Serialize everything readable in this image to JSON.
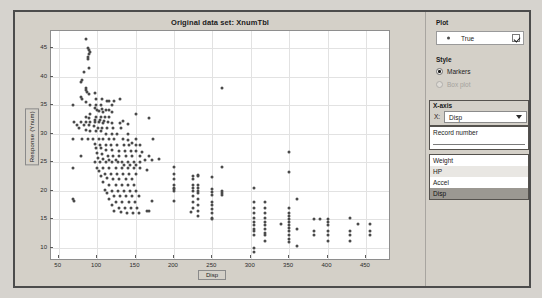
{
  "chart_data": {
    "type": "scatter",
    "title": "Original data set: XnumTbl",
    "xlabel": "Disp",
    "ylabel": "Response (Ynum)",
    "xlim": [
      40,
      480
    ],
    "ylim": [
      8,
      48
    ],
    "xticks": [
      50,
      100,
      150,
      200,
      250,
      300,
      350,
      400,
      450
    ],
    "yticks": [
      10,
      15,
      20,
      25,
      30,
      35,
      40,
      45
    ],
    "grid": true,
    "legend_position": "right-panel",
    "marker_color": "#4a4a4a",
    "series": [
      {
        "name": "True",
        "points": [
          [
            85,
            46.6
          ],
          [
            88,
            45.0
          ],
          [
            90,
            44.6
          ],
          [
            91,
            44.3
          ],
          [
            89,
            44.0
          ],
          [
            88,
            43.4
          ],
          [
            88,
            43.1
          ],
          [
            90,
            41.5
          ],
          [
            83,
            40.8
          ],
          [
            81,
            39.4
          ],
          [
            79,
            39.1
          ],
          [
            85,
            38.0
          ],
          [
            262,
            38.0
          ],
          [
            86,
            37.7
          ],
          [
            87,
            37.3
          ],
          [
            97,
            37.2
          ],
          [
            89,
            37.0
          ],
          [
            79,
            36.4
          ],
          [
            80,
            36.1
          ],
          [
            98,
            36.0
          ],
          [
            107,
            36.0
          ],
          [
            113,
            35.7
          ],
          [
            116,
            35.7
          ],
          [
            122,
            35.7
          ],
          [
            130,
            36.0
          ],
          [
            86,
            35.5
          ],
          [
            91,
            35.1
          ],
          [
            98,
            35.0
          ],
          [
            68,
            35.0
          ],
          [
            105,
            35.0
          ],
          [
            119,
            35.0
          ],
          [
            97,
            34.5
          ],
          [
            107,
            34.4
          ],
          [
            112,
            34.2
          ],
          [
            116,
            34.1
          ],
          [
            100,
            34.1
          ],
          [
            103,
            34.0
          ],
          [
            108,
            33.8
          ],
          [
            120,
            33.8
          ],
          [
            91,
            33.5
          ],
          [
            151,
            33.5
          ],
          [
            98,
            33.0
          ],
          [
            105,
            33.0
          ],
          [
            110,
            33.0
          ],
          [
            116,
            33.0
          ],
          [
            85,
            32.9
          ],
          [
            90,
            32.8
          ],
          [
            168,
            32.8
          ],
          [
            97,
            32.4
          ],
          [
            104,
            32.3
          ],
          [
            109,
            32.2
          ],
          [
            134,
            32.2
          ],
          [
            114,
            32.1
          ],
          [
            70,
            32.0
          ],
          [
            79,
            32.0
          ],
          [
            85,
            32.0
          ],
          [
            91,
            32.0
          ],
          [
            97,
            32.0
          ],
          [
            103,
            32.0
          ],
          [
            108,
            31.9
          ],
          [
            119,
            31.9
          ],
          [
            130,
            31.8
          ],
          [
            140,
            31.6
          ],
          [
            74,
            31.5
          ],
          [
            83,
            31.5
          ],
          [
            89,
            31.5
          ],
          [
            96,
            31.3
          ],
          [
            101,
            31.0
          ],
          [
            107,
            31.0
          ],
          [
            113,
            31.0
          ],
          [
            121,
            31.0
          ],
          [
            131,
            31.0
          ],
          [
            76,
            30.9
          ],
          [
            85,
            30.7
          ],
          [
            91,
            30.5
          ],
          [
            98,
            30.5
          ],
          [
            105,
            30.4
          ],
          [
            112,
            30.0
          ],
          [
            119,
            30.0
          ],
          [
            126,
            30.0
          ],
          [
            140,
            30.0
          ],
          [
            68,
            29.0
          ],
          [
            81,
            29.0
          ],
          [
            88,
            29.0
          ],
          [
            95,
            29.0
          ],
          [
            102,
            29.0
          ],
          [
            108,
            29.0
          ],
          [
            116,
            29.0
          ],
          [
            122,
            29.0
          ],
          [
            134,
            29.0
          ],
          [
            150,
            29.0
          ],
          [
            173,
            29.0
          ],
          [
            140,
            28.8
          ],
          [
            146,
            28.4
          ],
          [
            97,
            28.1
          ],
          [
            104,
            28.0
          ],
          [
            111,
            28.0
          ],
          [
            118,
            28.0
          ],
          [
            126,
            28.0
          ],
          [
            135,
            28.0
          ],
          [
            141,
            28.0
          ],
          [
            151,
            28.0
          ],
          [
            156,
            28.0
          ],
          [
            98,
            27.5
          ],
          [
            105,
            27.4
          ],
          [
            112,
            27.2
          ],
          [
            120,
            27.2
          ],
          [
            128,
            27.0
          ],
          [
            136,
            27.0
          ],
          [
            144,
            27.0
          ],
          [
            151,
            27.0
          ],
          [
            159,
            26.8
          ],
          [
            100,
            26.6
          ],
          [
            107,
            26.5
          ],
          [
            114,
            26.0
          ],
          [
            121,
            26.0
          ],
          [
            129,
            26.0
          ],
          [
            137,
            26.0
          ],
          [
            145,
            26.0
          ],
          [
            156,
            26.0
          ],
          [
            168,
            26.0
          ],
          [
            79,
            26.0
          ],
          [
            350,
            26.8
          ],
          [
            101,
            25.8
          ],
          [
            108,
            25.5
          ],
          [
            116,
            25.4
          ],
          [
            124,
            25.4
          ],
          [
            132,
            25.1
          ],
          [
            140,
            25.0
          ],
          [
            148,
            25.0
          ],
          [
            156,
            25.0
          ],
          [
            163,
            25.4
          ],
          [
            171,
            25.4
          ],
          [
            181,
            25.5
          ],
          [
            200,
            24.2
          ],
          [
            262,
            24.1
          ],
          [
            350,
            23.2
          ],
          [
            97,
            25.0
          ],
          [
            104,
            25.0
          ],
          [
            112,
            25.0
          ],
          [
            119,
            25.0
          ],
          [
            127,
            25.0
          ],
          [
            135,
            24.5
          ],
          [
            143,
            24.5
          ],
          [
            151,
            24.5
          ],
          [
            68,
            24.0
          ],
          [
            100,
            24.0
          ],
          [
            108,
            24.0
          ],
          [
            116,
            24.0
          ],
          [
            124,
            24.0
          ],
          [
            132,
            24.0
          ],
          [
            140,
            24.0
          ],
          [
            148,
            24.0
          ],
          [
            156,
            24.0
          ],
          [
            165,
            23.6
          ],
          [
            200,
            23.0
          ],
          [
            225,
            22.5
          ],
          [
            232,
            22.8
          ],
          [
            250,
            22.3
          ],
          [
            103,
            23.5
          ],
          [
            110,
            23.0
          ],
          [
            118,
            23.0
          ],
          [
            126,
            23.0
          ],
          [
            134,
            23.0
          ],
          [
            142,
            23.0
          ],
          [
            150,
            23.0
          ],
          [
            200,
            22.0
          ],
          [
            225,
            22.0
          ],
          [
            232,
            22.5
          ],
          [
            105,
            22.5
          ],
          [
            113,
            22.2
          ],
          [
            121,
            22.0
          ],
          [
            129,
            22.0
          ],
          [
            137,
            22.0
          ],
          [
            145,
            22.0
          ],
          [
            200,
            21.0
          ],
          [
            225,
            21.0
          ],
          [
            232,
            21.0
          ],
          [
            250,
            20.2
          ],
          [
            262,
            20.0
          ],
          [
            108,
            21.5
          ],
          [
            116,
            21.0
          ],
          [
            124,
            21.0
          ],
          [
            132,
            21.0
          ],
          [
            140,
            21.0
          ],
          [
            148,
            21.0
          ],
          [
            200,
            20.5
          ],
          [
            225,
            20.5
          ],
          [
            232,
            20.5
          ],
          [
            250,
            19.8
          ],
          [
            262,
            19.5
          ],
          [
            304,
            20.5
          ],
          [
            110,
            20.1
          ],
          [
            119,
            20.0
          ],
          [
            127,
            20.0
          ],
          [
            135,
            20.0
          ],
          [
            143,
            20.0
          ],
          [
            151,
            20.0
          ],
          [
            200,
            20.2
          ],
          [
            200,
            20.0
          ],
          [
            225,
            20.0
          ],
          [
            232,
            20.0
          ],
          [
            250,
            19.2
          ],
          [
            262,
            19.2
          ],
          [
            113,
            19.5
          ],
          [
            122,
            19.0
          ],
          [
            130,
            19.0
          ],
          [
            138,
            19.0
          ],
          [
            146,
            19.0
          ],
          [
            154,
            19.0
          ],
          [
            200,
            18.1
          ],
          [
            225,
            19.0
          ],
          [
            232,
            19.5
          ],
          [
            250,
            18.0
          ],
          [
            360,
            18.6
          ],
          [
            68,
            18.5
          ],
          [
            70,
            18.1
          ],
          [
            116,
            18.5
          ],
          [
            125,
            18.0
          ],
          [
            133,
            18.0
          ],
          [
            141,
            18.0
          ],
          [
            149,
            18.0
          ],
          [
            171,
            18.1
          ],
          [
            225,
            18.0
          ],
          [
            232,
            18.5
          ],
          [
            250,
            17.5
          ],
          [
            304,
            18.0
          ],
          [
            318,
            18.0
          ],
          [
            119,
            17.5
          ],
          [
            128,
            17.0
          ],
          [
            136,
            17.0
          ],
          [
            144,
            17.0
          ],
          [
            152,
            17.0
          ],
          [
            165,
            16.5
          ],
          [
            168,
            16.5
          ],
          [
            225,
            17.0
          ],
          [
            232,
            17.5
          ],
          [
            250,
            16.8
          ],
          [
            304,
            17.0
          ],
          [
            318,
            17.0
          ],
          [
            350,
            17.0
          ],
          [
            122,
            16.5
          ],
          [
            131,
            16.2
          ],
          [
            139,
            16.0
          ],
          [
            147,
            16.0
          ],
          [
            155,
            16.0
          ],
          [
            222,
            16.2
          ],
          [
            232,
            16.5
          ],
          [
            250,
            16.0
          ],
          [
            304,
            16.0
          ],
          [
            318,
            16.0
          ],
          [
            350,
            16.0
          ],
          [
            232,
            15.5
          ],
          [
            250,
            15.2
          ],
          [
            250,
            15.0
          ],
          [
            304,
            15.2
          ],
          [
            318,
            15.2
          ],
          [
            350,
            15.5
          ],
          [
            350,
            15.0
          ],
          [
            383,
            15.0
          ],
          [
            390,
            15.0
          ],
          [
            400,
            15.0
          ],
          [
            429,
            15.2
          ],
          [
            304,
            14.5
          ],
          [
            318,
            14.5
          ],
          [
            340,
            14.2
          ],
          [
            350,
            14.5
          ],
          [
            400,
            14.5
          ],
          [
            440,
            14.2
          ],
          [
            455,
            14.2
          ],
          [
            304,
            14.0
          ],
          [
            318,
            14.0
          ],
          [
            350,
            14.0
          ],
          [
            400,
            14.0
          ],
          [
            304,
            13.2
          ],
          [
            318,
            13.2
          ],
          [
            350,
            13.5
          ],
          [
            360,
            13.2
          ],
          [
            383,
            13.0
          ],
          [
            400,
            13.0
          ],
          [
            429,
            13.0
          ],
          [
            455,
            13.0
          ],
          [
            304,
            13.0
          ],
          [
            318,
            12.5
          ],
          [
            350,
            13.0
          ],
          [
            304,
            12.2
          ],
          [
            318,
            12.2
          ],
          [
            350,
            12.2
          ],
          [
            383,
            12.2
          ],
          [
            400,
            12.2
          ],
          [
            429,
            12.2
          ],
          [
            455,
            12.2
          ],
          [
            350,
            11.5
          ],
          [
            400,
            11.2
          ],
          [
            429,
            11.2
          ],
          [
            318,
            11.2
          ],
          [
            350,
            11.0
          ],
          [
            360,
            10.2
          ],
          [
            304,
            10.0
          ],
          [
            304,
            9.2
          ]
        ]
      }
    ]
  },
  "plot_group": {
    "label": "Plot",
    "legend_entry": "True",
    "checked": true
  },
  "style_group": {
    "label": "Style",
    "options": [
      {
        "label": "Markers",
        "selected": true,
        "disabled": false
      },
      {
        "label": "Box plot",
        "selected": false,
        "disabled": true
      }
    ]
  },
  "xaxis_group": {
    "label": "X-axis",
    "prefix": "X:",
    "selected_value": "Disp",
    "top_item": "Record number",
    "options": [
      "Weight",
      "HP",
      "Accel",
      "Disp"
    ],
    "selected_option_index": 3
  }
}
